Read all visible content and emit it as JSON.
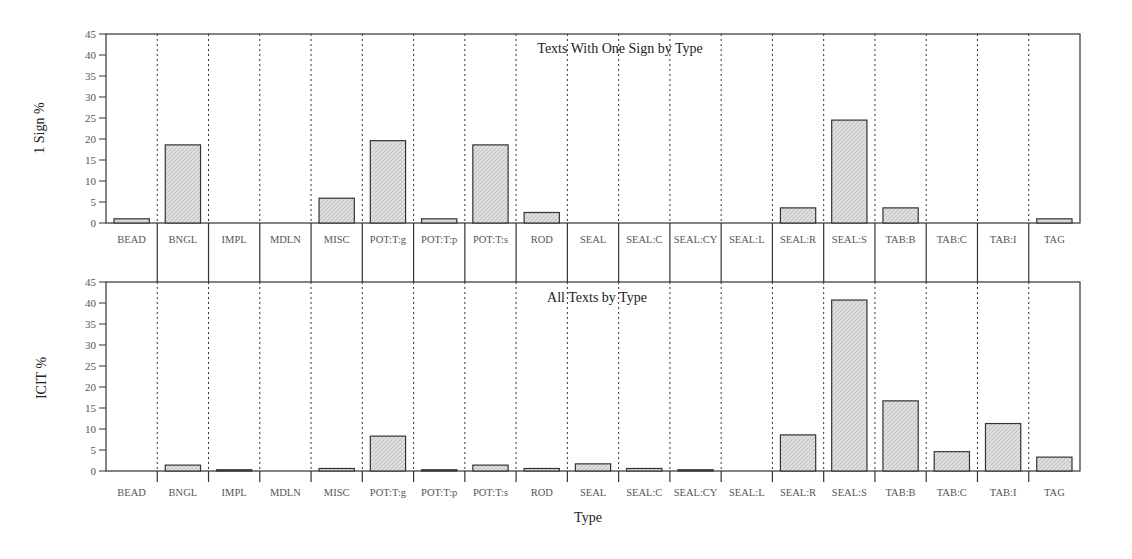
{
  "chart_data": [
    {
      "type": "bar",
      "title": "Texts With One Sign by Type",
      "xlabel": "",
      "ylabel": "1 Sign %",
      "ylim": [
        0,
        45
      ],
      "yticks": [
        0,
        5,
        10,
        15,
        20,
        25,
        30,
        35,
        40,
        45
      ],
      "grid": "vertical dotted dividers between categories",
      "categories": [
        "BEAD",
        "BNGL",
        "IMPL",
        "MDLN",
        "MISC",
        "POT:T:g",
        "POT:T:p",
        "POT:T:s",
        "ROD",
        "SEAL",
        "SEAL:C",
        "SEAL:CY",
        "SEAL:L",
        "SEAL:R",
        "SEAL:S",
        "TAB:B",
        "TAB:C",
        "TAB:I",
        "TAG"
      ],
      "values": [
        1.0,
        18.6,
        0,
        0,
        5.9,
        19.6,
        1.0,
        18.6,
        2.5,
        0,
        0,
        0,
        0,
        3.6,
        24.5,
        3.6,
        0,
        0,
        1.0
      ]
    },
    {
      "type": "bar",
      "title": "All Texts by Type",
      "xlabel": "Type",
      "ylabel": "ICIT %",
      "ylim": [
        0,
        45
      ],
      "yticks": [
        0,
        5,
        10,
        15,
        20,
        25,
        30,
        35,
        40,
        45
      ],
      "grid": "vertical dotted dividers between categories",
      "categories": [
        "BEAD",
        "BNGL",
        "IMPL",
        "MDLN",
        "MISC",
        "POT:T:g",
        "POT:T:p",
        "POT:T:s",
        "ROD",
        "SEAL",
        "SEAL:C",
        "SEAL:CY",
        "SEAL:L",
        "SEAL:R",
        "SEAL:S",
        "TAB:B",
        "TAB:C",
        "TAB:I",
        "TAG"
      ],
      "values": [
        0,
        1.4,
        0.3,
        0,
        0.6,
        8.3,
        0.3,
        1.4,
        0.6,
        1.7,
        0.6,
        0.3,
        0,
        8.6,
        40.7,
        16.7,
        4.6,
        11.3,
        3.3
      ]
    }
  ],
  "colors": {
    "bar_fill": "#d9d9d9",
    "bar_hatch": "#bdbdbd",
    "bar_stroke": "#333333",
    "axis": "#333333"
  }
}
